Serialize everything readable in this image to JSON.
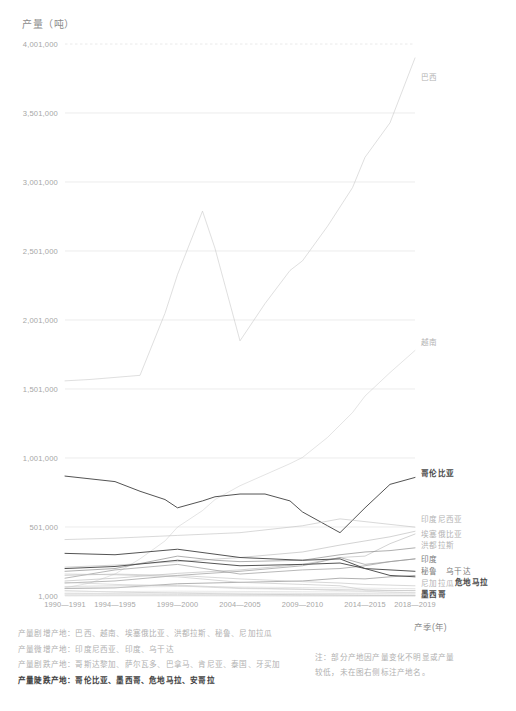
{
  "chart_data": {
    "type": "line",
    "title": "产量（吨）",
    "ylabel": "产量（吨）",
    "xlabel": "产季(年)",
    "grid": true,
    "legend_position": "right-inline-end-labels",
    "ylim": [
      1000,
      4001000
    ],
    "yticks": [
      "1,000",
      "501,000",
      "1,001,000",
      "1,501,000",
      "2,001,000",
      "2,501,000",
      "3,001,000",
      "3,501,000",
      "4,001,000"
    ],
    "ytick_values": [
      1000,
      501000,
      1001000,
      1501000,
      2001000,
      2501000,
      3001000,
      3501000,
      4001000
    ],
    "xticks": [
      "1990—1991",
      "1994—1995",
      "1999—2000",
      "2004—2005",
      "2009—2010",
      "2014—2015",
      "2018—2019"
    ],
    "xtick_values": [
      1990,
      1994,
      1999,
      2004,
      2009,
      2014,
      2018
    ],
    "xlim": [
      1990,
      2018
    ],
    "series": [
      {
        "name": "巴西",
        "label": "巴西",
        "color": "#c9c9c9",
        "emphasis": "light",
        "x": [
          1990,
          1992,
          1994,
          1996,
          1998,
          1999,
          2001,
          2002,
          2004,
          2006,
          2008,
          2009,
          2011,
          2013,
          2014,
          2016,
          2018
        ],
        "values": [
          1560000,
          1570000,
          1585000,
          1600000,
          2050000,
          2330000,
          2790000,
          2520000,
          1850000,
          2120000,
          2360000,
          2430000,
          2680000,
          2960000,
          3180000,
          3430000,
          3900000
        ]
      },
      {
        "name": "越南",
        "label": "越南",
        "color": "#d2d2d2",
        "emphasis": "light",
        "x": [
          1990,
          1992,
          1994,
          1996,
          1998,
          1999,
          2001,
          2002,
          2004,
          2006,
          2008,
          2009,
          2011,
          2013,
          2014,
          2016,
          2018
        ],
        "values": [
          60000,
          95000,
          160000,
          270000,
          400000,
          500000,
          620000,
          700000,
          800000,
          880000,
          960000,
          1005000,
          1150000,
          1330000,
          1450000,
          1620000,
          1780000
        ]
      },
      {
        "name": "哥伦比亚",
        "label": "哥伦比亚",
        "color": "#4a4a4a",
        "emphasis": "strong",
        "x": [
          1990,
          1992,
          1994,
          1996,
          1998,
          1999,
          2001,
          2002,
          2004,
          2006,
          2008,
          2009,
          2011,
          2012,
          2014,
          2016,
          2018
        ],
        "values": [
          870000,
          850000,
          830000,
          760000,
          700000,
          640000,
          690000,
          720000,
          740000,
          740000,
          690000,
          610000,
          510000,
          460000,
          640000,
          810000,
          860000
        ]
      },
      {
        "name": "印度尼西亚",
        "label": "印度尼西亚",
        "color": "#c0c0c0",
        "emphasis": "light",
        "x": [
          1990,
          1994,
          1999,
          2004,
          2009,
          2012,
          2014,
          2016,
          2018
        ],
        "values": [
          410000,
          420000,
          440000,
          460000,
          510000,
          560000,
          540000,
          520000,
          500000
        ]
      },
      {
        "name": "埃塞俄比亚",
        "label": "埃塞俄比亚",
        "color": "#b6b6b6",
        "emphasis": "light",
        "x": [
          1990,
          1994,
          1999,
          2004,
          2009,
          2012,
          2014,
          2016,
          2018
        ],
        "values": [
          210000,
          225000,
          250000,
          280000,
          320000,
          370000,
          400000,
          430000,
          470000
        ]
      },
      {
        "name": "洪都拉斯",
        "label": "洪都拉斯",
        "color": "#b6b6b6",
        "emphasis": "light",
        "x": [
          1990,
          1994,
          1999,
          2004,
          2009,
          2012,
          2014,
          2016,
          2018
        ],
        "values": [
          110000,
          130000,
          165000,
          190000,
          230000,
          280000,
          290000,
          380000,
          450000
        ]
      },
      {
        "name": "印度",
        "label": "印度",
        "color": "#8c8c8c",
        "emphasis": "mid",
        "x": [
          1990,
          1994,
          1999,
          2002,
          2004,
          2009,
          2012,
          2014,
          2016,
          2018
        ],
        "values": [
          180000,
          200000,
          290000,
          260000,
          250000,
          260000,
          300000,
          320000,
          330000,
          350000
        ]
      },
      {
        "name": "秘鲁",
        "label": "秘鲁",
        "color": "#9a9a9a",
        "emphasis": "mid",
        "x": [
          1990,
          1994,
          1999,
          2004,
          2009,
          2012,
          2014,
          2016,
          2018
        ],
        "values": [
          95000,
          110000,
          150000,
          180000,
          220000,
          280000,
          230000,
          250000,
          270000
        ]
      },
      {
        "name": "乌干达",
        "label": "乌干达",
        "color": "#9a9a9a",
        "emphasis": "mid",
        "x": [
          1990,
          1994,
          1999,
          2004,
          2009,
          2012,
          2014,
          2016,
          2018
        ],
        "values": [
          130000,
          190000,
          230000,
          160000,
          190000,
          200000,
          220000,
          250000,
          270000
        ]
      },
      {
        "name": "尼加拉瓜",
        "label": "尼加拉瓜",
        "color": "#8f8f8f",
        "emphasis": "mid",
        "x": [
          1990,
          1994,
          1999,
          2004,
          2009,
          2012,
          2014,
          2016,
          2018
        ],
        "values": [
          55000,
          60000,
          90000,
          100000,
          110000,
          130000,
          125000,
          140000,
          150000
        ]
      },
      {
        "name": "危地马拉",
        "label": "危地马拉",
        "color": "#4a4a4a",
        "emphasis": "strong",
        "x": [
          1990,
          1994,
          1999,
          2004,
          2009,
          2012,
          2014,
          2016,
          2018
        ],
        "values": [
          200000,
          215000,
          260000,
          220000,
          230000,
          240000,
          200000,
          190000,
          180000
        ]
      },
      {
        "name": "墨西哥",
        "label": "墨西哥",
        "color": "#4a4a4a",
        "emphasis": "strong",
        "x": [
          1990,
          1994,
          1999,
          2004,
          2009,
          2012,
          2014,
          2016,
          2018
        ],
        "values": [
          310000,
          300000,
          340000,
          280000,
          260000,
          270000,
          200000,
          150000,
          140000
        ]
      },
      {
        "name": "哥斯达黎加",
        "label": "",
        "color": "#bdbdbd",
        "emphasis": "light",
        "x": [
          1990,
          1994,
          1999,
          2004,
          2009,
          2012,
          2014,
          2016,
          2018
        ],
        "values": [
          150000,
          160000,
          150000,
          125000,
          105000,
          95000,
          85000,
          80000,
          75000
        ]
      },
      {
        "name": "萨尔瓦多",
        "label": "",
        "color": "#bdbdbd",
        "emphasis": "light",
        "x": [
          1990,
          1994,
          1999,
          2004,
          2009,
          2012,
          2014,
          2016,
          2018
        ],
        "values": [
          160000,
          155000,
          140000,
          100000,
          85000,
          75000,
          45000,
          40000,
          42000
        ]
      },
      {
        "name": "巴拿马",
        "label": "",
        "color": "#cfcfcf",
        "emphasis": "light",
        "x": [
          1990,
          1994,
          1999,
          2004,
          2009,
          2012,
          2014,
          2016,
          2018
        ],
        "values": [
          14000,
          13000,
          12000,
          10000,
          9000,
          8000,
          7000,
          6500,
          6000
        ]
      },
      {
        "name": "肯尼亚",
        "label": "",
        "color": "#c7c7c7",
        "emphasis": "light",
        "x": [
          1990,
          1994,
          1999,
          2004,
          2009,
          2012,
          2014,
          2016,
          2018
        ],
        "values": [
          100000,
          85000,
          75000,
          55000,
          50000,
          48000,
          45000,
          42000,
          40000
        ]
      },
      {
        "name": "泰国",
        "label": "",
        "color": "#c7c7c7",
        "emphasis": "light",
        "x": [
          1990,
          1994,
          1999,
          2004,
          2009,
          2012,
          2014,
          2016,
          2018
        ],
        "values": [
          70000,
          75000,
          80000,
          60000,
          50000,
          40000,
          35000,
          28000,
          25000
        ]
      },
      {
        "name": "牙买加",
        "label": "",
        "color": "#d4d4d4",
        "emphasis": "light",
        "x": [
          1990,
          1994,
          1999,
          2004,
          2009,
          2012,
          2014,
          2016,
          2018
        ],
        "values": [
          4000,
          4500,
          5000,
          3500,
          2500,
          2000,
          1800,
          1500,
          1400
        ]
      },
      {
        "name": "安哥拉",
        "label": "",
        "color": "#c2c2c2",
        "emphasis": "light",
        "x": [
          1990,
          1994,
          1999,
          2004,
          2009,
          2012,
          2014,
          2016,
          2018
        ],
        "values": [
          40000,
          30000,
          22000,
          15000,
          10000,
          8000,
          6000,
          5000,
          4500
        ]
      },
      {
        "name": "其他产地A",
        "label": "",
        "color": "#d8d8d8",
        "emphasis": "light",
        "x": [
          1990,
          1994,
          1999,
          2004,
          2009,
          2012,
          2014,
          2016,
          2018
        ],
        "values": [
          60000,
          64000,
          70000,
          66000,
          62000,
          60000,
          58000,
          56000,
          55000
        ]
      },
      {
        "name": "其他产地B",
        "label": "",
        "color": "#dcdcdc",
        "emphasis": "light",
        "x": [
          1990,
          1994,
          1999,
          2004,
          2009,
          2012,
          2014,
          2016,
          2018
        ],
        "values": [
          30000,
          33000,
          36000,
          34000,
          32000,
          31000,
          30000,
          29000,
          28000
        ]
      },
      {
        "name": "其他产地C",
        "label": "",
        "color": "#d0d0d0",
        "emphasis": "light",
        "x": [
          1990,
          1994,
          1999,
          2004,
          2009,
          2012,
          2014,
          2016,
          2018
        ],
        "values": [
          18000,
          20000,
          24000,
          22000,
          20000,
          19000,
          18000,
          17000,
          16000
        ]
      }
    ]
  },
  "series_end_labels": [
    {
      "name": "巴西",
      "label": "巴西",
      "top": 74,
      "left": 421,
      "emphasis": "light"
    },
    {
      "name": "越南",
      "label": "越南",
      "top": 339,
      "left": 421,
      "emphasis": "light"
    },
    {
      "name": "哥伦比亚",
      "label": "哥伦比亚",
      "top": 470,
      "left": 421,
      "emphasis": "strong"
    },
    {
      "name": "印度尼西亚",
      "label": "印度尼西亚",
      "top": 516,
      "left": 421,
      "emphasis": "light"
    },
    {
      "name": "埃塞俄比亚",
      "label": "埃塞俄比亚",
      "top": 531,
      "left": 421,
      "emphasis": "light"
    },
    {
      "name": "洪都拉斯",
      "label": "洪都拉斯",
      "top": 542,
      "left": 421,
      "emphasis": "light"
    },
    {
      "name": "印度",
      "label": "印度",
      "top": 556,
      "left": 421,
      "emphasis": "mid"
    },
    {
      "name": "秘鲁",
      "label": "秘鲁",
      "top": 568,
      "left": 421,
      "emphasis": "mid"
    },
    {
      "name": "乌干达",
      "label": "乌干达",
      "top": 568,
      "left": 446,
      "emphasis": "mid"
    },
    {
      "name": "尼加拉瓜",
      "label": "尼加拉瓜",
      "top": 580,
      "left": 421,
      "emphasis": "light"
    },
    {
      "name": "危地马拉",
      "label": "危地马拉",
      "top": 579,
      "left": 455,
      "emphasis": "strong"
    },
    {
      "name": "墨西哥",
      "label": "墨西哥",
      "top": 591,
      "left": 421,
      "emphasis": "strong"
    }
  ],
  "footnotes": [
    {
      "text": "产量剧增产地：巴西、越南、埃塞俄比亚、洪都拉斯、秘鲁、尼加拉瓜",
      "strong": false
    },
    {
      "text": "产量微增产地：印度尼西亚、印度、乌干达",
      "strong": false
    },
    {
      "text": "产量剧跌产地：哥斯达黎加、萨尔瓦多、巴拿马、肯尼亚、泰国、牙买加",
      "strong": false
    },
    {
      "text": "产量陡跌产地：哥伦比亚、墨西哥、危地马拉、安哥拉",
      "strong": true
    }
  ],
  "remark": {
    "line1": "注：部分产地因产量变化不明显或产量",
    "line2": "较低，未在图右侧标注产地名。"
  },
  "colors": {
    "grid": "#e4e4e4",
    "tick_text": "#a6a6a6",
    "title_text": "#8c8c8c",
    "strong_series": "#4a4a4a",
    "light_series": "#c9c9c9",
    "background": "#ffffff"
  }
}
